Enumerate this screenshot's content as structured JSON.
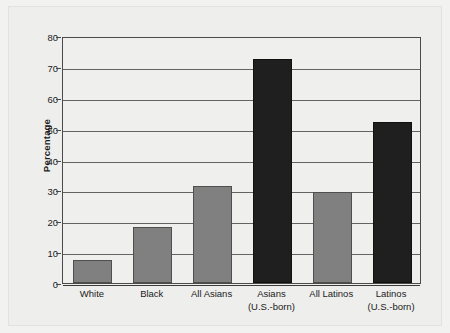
{
  "chart_data": {
    "type": "bar",
    "title": "",
    "subtitle": "",
    "xlabel": "",
    "ylabel": "Percentage",
    "ylim": [
      0,
      80
    ],
    "yticks": [
      0,
      10,
      20,
      30,
      40,
      50,
      60,
      70,
      80
    ],
    "ytick_labels": [
      "0",
      "10",
      "20",
      "30",
      "40",
      "50",
      "60",
      "70",
      "80"
    ],
    "grid": true,
    "legend": false,
    "legend_position": "none",
    "categories": [
      "White",
      "Black",
      "All Asians",
      "Asians (U.S.-born)",
      "All Latinos",
      "Latinos (U.S.-born)"
    ],
    "category_labels": [
      {
        "line1": "White",
        "line2": ""
      },
      {
        "line1": "Black",
        "line2": ""
      },
      {
        "line1": "All Asians",
        "line2": ""
      },
      {
        "line1": "Asians",
        "line2": "(U.S.-born)"
      },
      {
        "line1": "All Latinos",
        "line2": ""
      },
      {
        "line1": "Latinos",
        "line2": "(U.S.-born)"
      }
    ],
    "values": [
      7.5,
      18,
      31.5,
      72.5,
      29.5,
      52
    ],
    "bar_colors": [
      "#808080",
      "#808080",
      "#808080",
      "#1f1f1f",
      "#808080",
      "#1f1f1f"
    ],
    "bar_shades": [
      "gray",
      "gray",
      "gray",
      "dark",
      "gray",
      "dark"
    ],
    "colors": {
      "gray_bar": "#808080",
      "dark_bar": "#1f1f1f",
      "background": "#efefed",
      "page": "#f2f2f0",
      "axis": "#4a4a4a",
      "gridline": "#636363",
      "text": "#1b1b1b"
    }
  }
}
